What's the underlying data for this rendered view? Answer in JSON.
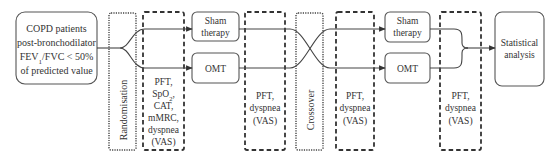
{
  "diagram": {
    "type": "flowchart",
    "colors": {
      "line": "#444444",
      "text": "#333333",
      "background": "#ffffff"
    },
    "population": {
      "lines": [
        "COPD patients",
        "post-bronchodilator",
        "FEV1/FVC < 50%",
        "of predicted value"
      ],
      "fev_main": "FEV",
      "fev_sub": "1",
      "fev_rest": "/FVC < 50%"
    },
    "randomisation": {
      "label": "Randomisation"
    },
    "baseline_assessment": {
      "lines": [
        "PFT,",
        "SpO2,",
        "CAT,",
        "mMRC,",
        "dyspnea",
        "(VAS)"
      ],
      "spo_main": "SpO",
      "spo_sub": "2",
      "spo_rest": ","
    },
    "period1": {
      "arm_a": {
        "line1": "Sham",
        "line2": "therapy"
      },
      "arm_b": {
        "label": "OMT"
      }
    },
    "assessment_after_period1": {
      "lines": [
        "PFT,",
        "dyspnea",
        "(VAS)"
      ]
    },
    "crossover": {
      "label": "Crossover"
    },
    "assessment_before_period2": {
      "lines": [
        "PFT,",
        "dyspnea",
        "(VAS)"
      ]
    },
    "period2": {
      "arm_a": {
        "line1": "Sham",
        "line2": "therapy"
      },
      "arm_b": {
        "label": "OMT"
      }
    },
    "assessment_after_period2": {
      "lines": [
        "PFT,",
        "dyspnea",
        "(VAS)"
      ]
    },
    "outcome": {
      "line1": "Statistical",
      "line2": "analysis"
    }
  }
}
